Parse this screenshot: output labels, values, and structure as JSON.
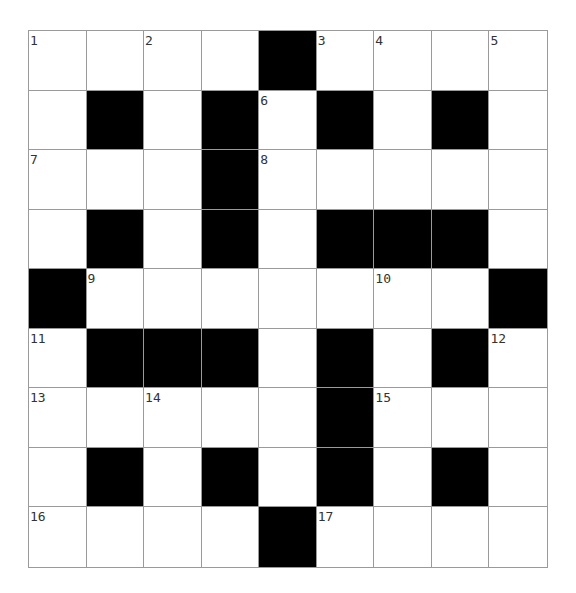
{
  "puzzle": {
    "rows": 9,
    "cols": 9,
    "layout": [
      "1.2.#345",
      ".#.#6#.#.",
      "7..#8....",
      ".#.#.###.",
      "#9...10.#",
      "11###.#.12",
      "13.14..#15..",
      ".#.#.#.#.",
      "16...#17..."
    ],
    "cells": [
      [
        {
          "n": "1"
        },
        {},
        {
          "n": "2"
        },
        {},
        {
          "b": true
        },
        {
          "n": "3"
        },
        {
          "n": "4"
        },
        {},
        {
          "n": "5"
        }
      ],
      [
        {},
        {
          "b": true
        },
        {},
        {
          "b": true
        },
        {
          "n": "6"
        },
        {
          "b": true
        },
        {},
        {
          "b": true
        },
        {}
      ],
      [
        {
          "n": "7"
        },
        {},
        {},
        {
          "b": true
        },
        {
          "n": "8"
        },
        {},
        {},
        {},
        {}
      ],
      [
        {},
        {
          "b": true
        },
        {},
        {
          "b": true
        },
        {},
        {
          "b": true
        },
        {
          "b": true
        },
        {
          "b": true
        },
        {}
      ],
      [
        {
          "b": true
        },
        {
          "n": "9"
        },
        {},
        {},
        {},
        {},
        {
          "n": "10"
        },
        {},
        {
          "b": true
        }
      ],
      [
        {
          "n": "11"
        },
        {
          "b": true
        },
        {
          "b": true
        },
        {
          "b": true
        },
        {},
        {
          "b": true
        },
        {},
        {
          "b": true
        },
        {
          "n": "12"
        }
      ],
      [
        {
          "n": "13"
        },
        {},
        {
          "n": "14"
        },
        {},
        {},
        {
          "b": true
        },
        {
          "n": "15"
        },
        {},
        {}
      ],
      [
        {},
        {
          "b": true
        },
        {},
        {
          "b": true
        },
        {},
        {
          "b": true
        },
        {},
        {
          "b": true
        },
        {}
      ],
      [
        {
          "n": "16"
        },
        {},
        {},
        {},
        {
          "b": true
        },
        {
          "n": "17"
        },
        {},
        {},
        {}
      ]
    ]
  },
  "colors": {
    "black_cell": "#000000",
    "white_cell": "#ffffff",
    "grid_line": "#9a9a9a",
    "number_text": "#333333"
  }
}
